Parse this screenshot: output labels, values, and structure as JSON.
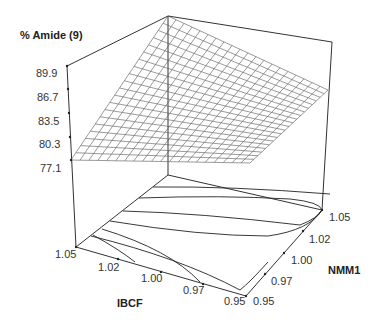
{
  "chart_data": {
    "type": "surface3d",
    "title": "",
    "zlabel": "% Amide (9)",
    "xlabel": "IBCF",
    "ylabel": "NMM1",
    "z_ticks": [
      "77.1",
      "80.3",
      "83.5",
      "86.7",
      "89.9"
    ],
    "x_ticks": [
      "1.05",
      "1.02",
      "1.00",
      "0.97",
      "0.95"
    ],
    "y_ticks": [
      "0.95",
      "0.97",
      "1.00",
      "1.02",
      "1.05"
    ],
    "zlim": [
      77.1,
      89.9
    ],
    "xlim": [
      0.95,
      1.05
    ],
    "ylim": [
      0.95,
      1.05
    ],
    "grid": "wireframe mesh on response surface; contour lines projected on floor",
    "surface_corners": [
      {
        "IBCF": 1.05,
        "NMM1": 0.95,
        "amide": 77.1
      },
      {
        "IBCF": 1.05,
        "NMM1": 1.05,
        "amide": 89.9
      },
      {
        "IBCF": 0.95,
        "NMM1": 1.05,
        "amide": 84.5
      },
      {
        "IBCF": 0.95,
        "NMM1": 0.95,
        "amide": 77.1
      }
    ],
    "legend": null
  },
  "axes": {
    "z_title": "% Amide (9)",
    "x_title": "IBCF",
    "y_title": "NMM1"
  }
}
